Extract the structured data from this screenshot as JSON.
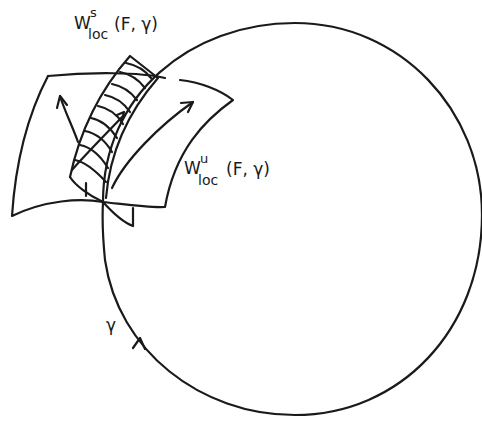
{
  "figure": {
    "type": "phase-portrait-diagram",
    "stroke_color": "#1a1a1a",
    "background": "#ffffff",
    "labels": {
      "stable_manifold": {
        "base": "W",
        "superscript": "s",
        "subscript": "loc",
        "args": "(F, γ)"
      },
      "unstable_manifold": {
        "base": "W",
        "superscript": "u",
        "subscript": "loc",
        "args": "(F, γ)"
      },
      "orbit": "γ"
    },
    "elements": [
      "periodic-orbit-circle",
      "orbit-direction-arrow",
      "local-unstable-manifold-sheet",
      "local-stable-manifold-hatched-strip",
      "flow-arrows"
    ]
  }
}
